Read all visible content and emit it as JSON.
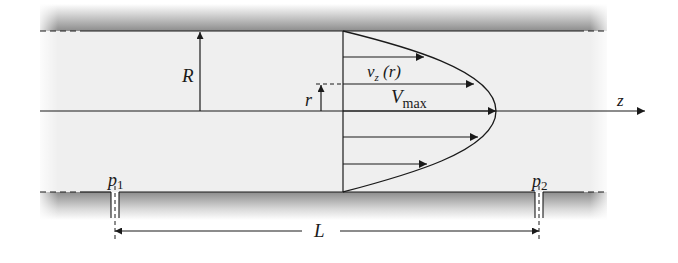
{
  "figure": {
    "type": "Poiseuille flow in a circular pipe (velocity profile)",
    "labels": {
      "radius": "R",
      "radial_coordinate": "r",
      "velocity_main": "v",
      "velocity_sub": "z",
      "velocity_arg": " (r)",
      "vmax_main": "V",
      "vmax_sub": "max",
      "axis": "z",
      "pressure1_main": "p",
      "pressure1_sub": "1",
      "pressure2_main": "p",
      "pressure2_sub": "2",
      "length": "L"
    },
    "colors": {
      "line": "#1a1a1a",
      "fluid": "#efefef",
      "wall_shade": "#8a8a8a",
      "background": "#ffffff"
    }
  }
}
